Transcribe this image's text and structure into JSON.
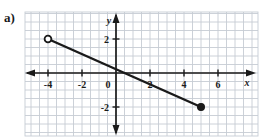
{
  "figure": {
    "part_label": "a)",
    "cropped_header_text": "",
    "background_color": "#ffffff",
    "grid_color": "#c6ccd4",
    "axis_color": "#1a1a1a",
    "line_color": "#1a1a1a"
  },
  "chart_data": {
    "type": "line",
    "title": "",
    "subtitle": "",
    "xlabel": "x",
    "ylabel": "y",
    "xlim": [
      -5.5,
      8.5
    ],
    "ylim": [
      -3.5,
      3.5
    ],
    "grid": true,
    "grid_step": 0.5,
    "legend": null,
    "x_ticks": [
      -4,
      -2,
      0,
      2,
      4,
      6
    ],
    "x_tick_labels": [
      "-4",
      "-2",
      "0",
      "2",
      "4",
      "6"
    ],
    "y_ticks": [
      2,
      -2
    ],
    "y_tick_labels": [
      "2",
      "-2"
    ],
    "origin_label": "0",
    "series": [
      {
        "name": "segment",
        "type": "segment",
        "x": [
          -4,
          5
        ],
        "y": [
          2,
          -2
        ],
        "slope": -0.4444,
        "intercept": 0.2222,
        "endpoints": [
          {
            "x": -4,
            "y": 2,
            "marker": "open-circle",
            "included": false
          },
          {
            "x": 5,
            "y": -2,
            "marker": "filled-circle",
            "included": true
          }
        ]
      }
    ],
    "axis_arrows": {
      "x_positive": true,
      "x_negative": true,
      "y_positive": true,
      "y_negative": true
    }
  }
}
